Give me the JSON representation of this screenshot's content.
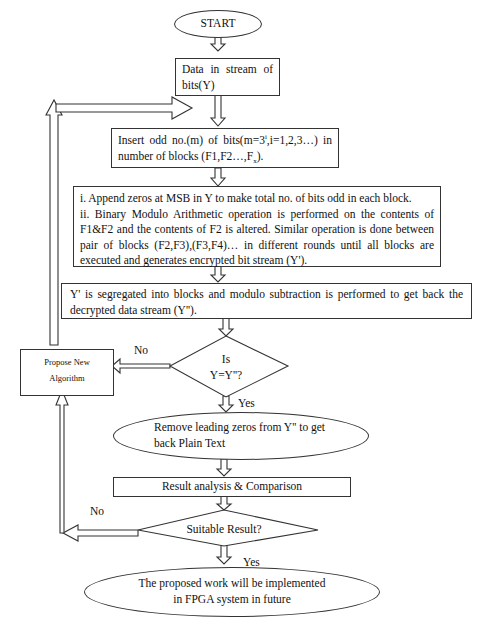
{
  "flowchart": {
    "start": "START",
    "data_in": "Data in stream of bits(Y)",
    "insert": {
      "line1_pre": "Insert odd no.(m) of bits(m=3",
      "sup": "i",
      "line1_post": ",i=1,2,3…) in number of blocks (F1,F2…,F",
      "sub": "x",
      "end": ")."
    },
    "encrypt": {
      "step1": "i. Append zeros at MSB in Y to make total no. of bits odd in each block.",
      "step2": "ii. Binary Modulo Arithmetic operation is performed on the contents of F1&F2 and the contents of F2 is altered. Similar operation is done between pair of blocks (F2,F3),(F3,F4)… in different rounds until all blocks are executed and generates  encrypted bit stream (Y')."
    },
    "decrypt": "Y' is segregated into blocks and modulo subtraction is performed to get back the decrypted data stream (Y'').",
    "decision1": {
      "line1": "Is",
      "line2": "Y=Y''?"
    },
    "decision1_no": "No",
    "decision1_yes": "Yes",
    "propose": {
      "line1": "Propose New",
      "line2": "Algorithm"
    },
    "remove_zeros": "Remove leading zeros from Y'' to get back Plain Text",
    "result_analysis": "Result analysis & Comparison",
    "decision2": "Suitable  Result?",
    "decision2_no": "No",
    "decision2_yes": "Yes",
    "end": "The proposed work will be implemented in FPGA system in future"
  },
  "colors": {
    "stroke": "#333333",
    "fill": "#ffffff",
    "text": "#111111"
  }
}
